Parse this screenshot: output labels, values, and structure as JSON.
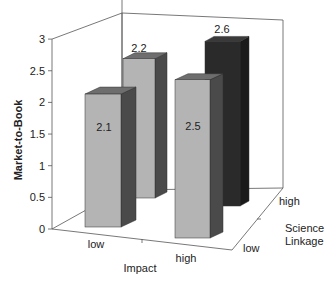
{
  "chart_data": {
    "type": "bar",
    "variant": "3d-grouped",
    "title": "",
    "xlabel": "Impact",
    "ylabel": "Market-to-Book",
    "zlabel": [
      "Science",
      "Linkage"
    ],
    "categories": [
      "low",
      "high"
    ],
    "depth_categories": [
      "low",
      "high"
    ],
    "series": [
      {
        "name": "Science Linkage low",
        "values": [
          2.1,
          2.5
        ]
      },
      {
        "name": "Science Linkage high",
        "values": [
          2.2,
          2.6
        ]
      }
    ],
    "data_labels": [
      "2.1",
      "2.2",
      "2.5",
      "2.6"
    ],
    "ylim": [
      0,
      3
    ],
    "yticks": [
      "0",
      "0.5",
      "1",
      "1.5",
      "2",
      "2.5",
      "3"
    ],
    "grid": false,
    "legend": "none"
  },
  "colors": {
    "bar_front_light": "#b4b4b4",
    "bar_side_light": "#4a4a4a",
    "bar_top_light": "#6e6e6e",
    "bar_front_dark": "#2a2a2a",
    "bar_side_dark": "#1a1a1a",
    "bar_top_dark": "#3a3a3a",
    "axis": "#555555"
  }
}
